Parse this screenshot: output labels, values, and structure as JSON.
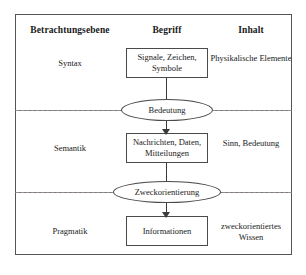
{
  "diagram": {
    "columns": [
      {
        "key": "betrachtungsebene",
        "label": "Betrachtungsebene"
      },
      {
        "key": "begriff",
        "label": "Begriff"
      },
      {
        "key": "inhalt",
        "label": "Inhalt"
      }
    ],
    "rows": [
      {
        "level": "Syntax",
        "concept": "Signale, Zeichen, Symbole",
        "content": "Physikalische Elemente"
      },
      {
        "level": "Semantik",
        "concept": "Nachrichten, Daten, Mitteilungen",
        "content": "Sinn, Bedeutung"
      },
      {
        "level": "Pragmatik",
        "concept": "Informationen",
        "content": "zweckorientiertes Wissen"
      }
    ],
    "transitions": [
      {
        "label": "Bedeutung",
        "from": "Syntax",
        "to": "Semantik"
      },
      {
        "label": "Zweckorientierung",
        "from": "Semantik",
        "to": "Pragmatik"
      }
    ],
    "colors": {
      "frame_border": "#555555",
      "row_divider": "#777777",
      "dashed_line": "#9a8f93",
      "box_border": "#4a4a4a",
      "arrow": "#3a3a3a",
      "text": "#1a1a1a",
      "background": "#ffffff"
    }
  }
}
